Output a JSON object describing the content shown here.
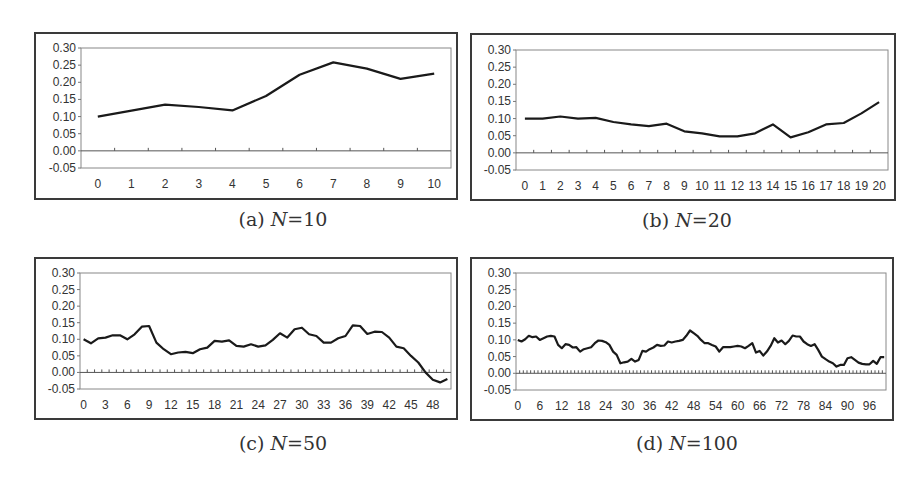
{
  "chart_data": [
    {
      "id": "a",
      "type": "line",
      "caption": {
        "label": "(a)",
        "var": "N",
        "eq": "=10"
      },
      "x": [
        0,
        1,
        2,
        3,
        4,
        5,
        6,
        7,
        8,
        9,
        10
      ],
      "x_tick_labels": [
        "0",
        "1",
        "2",
        "3",
        "4",
        "5",
        "6",
        "7",
        "8",
        "9",
        "10"
      ],
      "x_label_step": 1,
      "values": [
        0.1,
        0.117,
        0.135,
        0.128,
        0.118,
        0.16,
        0.222,
        0.258,
        0.24,
        0.21,
        0.225
      ],
      "y_tick_labels": [
        "0.30",
        "0.25",
        "0.20",
        "0.15",
        "0.10",
        "0.05",
        "0.00",
        "-0.05"
      ],
      "ylim": [
        -0.05,
        0.3
      ],
      "xlabel": "",
      "ylabel": "",
      "grid": false,
      "legend": null
    },
    {
      "id": "b",
      "type": "line",
      "caption": {
        "label": "(b)",
        "var": "N",
        "eq": "=20"
      },
      "x": [
        0,
        1,
        2,
        3,
        4,
        5,
        6,
        7,
        8,
        9,
        10,
        11,
        12,
        13,
        14,
        15,
        16,
        17,
        18,
        19,
        20
      ],
      "x_tick_labels": [
        "0",
        "1",
        "2",
        "3",
        "4",
        "5",
        "6",
        "7",
        "8",
        "9",
        "10",
        "11",
        "12",
        "13",
        "14",
        "15",
        "16",
        "17",
        "18",
        "19",
        "20"
      ],
      "x_label_step": 1,
      "values": [
        0.1,
        0.1,
        0.106,
        0.1,
        0.102,
        0.09,
        0.083,
        0.078,
        0.085,
        0.063,
        0.057,
        0.048,
        0.048,
        0.057,
        0.083,
        0.045,
        0.06,
        0.083,
        0.087,
        0.115,
        0.148
      ],
      "y_tick_labels": [
        "0.30",
        "0.25",
        "0.20",
        "0.15",
        "0.10",
        "0.05",
        "0.00",
        "-0.05"
      ],
      "ylim": [
        -0.05,
        0.3
      ],
      "xlabel": "",
      "ylabel": "",
      "grid": false,
      "legend": null
    },
    {
      "id": "c",
      "type": "line",
      "caption": {
        "label": "(c)",
        "var": "N",
        "eq": "=50"
      },
      "x_count": 51,
      "x_tick_labels": [
        "0",
        "3",
        "6",
        "9",
        "12",
        "15",
        "18",
        "21",
        "24",
        "27",
        "30",
        "33",
        "36",
        "39",
        "42",
        "45",
        "48"
      ],
      "x_label_step": 3,
      "values": [
        0.1,
        0.088,
        0.103,
        0.105,
        0.112,
        0.112,
        0.1,
        0.115,
        0.138,
        0.14,
        0.09,
        0.07,
        0.055,
        0.06,
        0.062,
        0.058,
        0.07,
        0.075,
        0.095,
        0.093,
        0.097,
        0.08,
        0.078,
        0.085,
        0.078,
        0.082,
        0.098,
        0.118,
        0.105,
        0.13,
        0.135,
        0.115,
        0.11,
        0.09,
        0.09,
        0.103,
        0.11,
        0.142,
        0.14,
        0.116,
        0.123,
        0.122,
        0.105,
        0.078,
        0.073,
        0.05,
        0.03,
        0.0,
        -0.022,
        -0.03,
        -0.02
      ],
      "y_tick_labels": [
        "0.30",
        "0.25",
        "0.20",
        "0.15",
        "0.10",
        "0.05",
        "0.00",
        "-0.05"
      ],
      "ylim": [
        -0.05,
        0.3
      ],
      "xlabel": "",
      "ylabel": "",
      "grid": false,
      "legend": null
    },
    {
      "id": "d",
      "type": "line",
      "caption": {
        "label": "(d)",
        "var": "N",
        "eq": "=100"
      },
      "x_count": 101,
      "x_tick_labels": [
        "0",
        "6",
        "12",
        "18",
        "24",
        "30",
        "36",
        "42",
        "48",
        "54",
        "60",
        "66",
        "72",
        "78",
        "84",
        "90",
        "96"
      ],
      "x_label_step": 6,
      "values": [
        0.1,
        0.095,
        0.102,
        0.112,
        0.108,
        0.11,
        0.1,
        0.105,
        0.11,
        0.112,
        0.11,
        0.085,
        0.075,
        0.087,
        0.085,
        0.077,
        0.078,
        0.065,
        0.072,
        0.075,
        0.078,
        0.09,
        0.098,
        0.097,
        0.093,
        0.085,
        0.065,
        0.055,
        0.03,
        0.033,
        0.035,
        0.043,
        0.035,
        0.04,
        0.067,
        0.065,
        0.072,
        0.077,
        0.085,
        0.082,
        0.083,
        0.095,
        0.092,
        0.095,
        0.097,
        0.1,
        0.112,
        0.128,
        0.12,
        0.112,
        0.1,
        0.09,
        0.09,
        0.085,
        0.08,
        0.065,
        0.078,
        0.078,
        0.078,
        0.08,
        0.082,
        0.08,
        0.075,
        0.082,
        0.09,
        0.062,
        0.067,
        0.053,
        0.065,
        0.082,
        0.105,
        0.092,
        0.098,
        0.087,
        0.097,
        0.113,
        0.11,
        0.11,
        0.095,
        0.087,
        0.082,
        0.087,
        0.07,
        0.05,
        0.042,
        0.035,
        0.03,
        0.02,
        0.025,
        0.025,
        0.045,
        0.048,
        0.04,
        0.032,
        0.028,
        0.027,
        0.027,
        0.037,
        0.028,
        0.048,
        0.048
      ],
      "y_tick_labels": [
        "0.30",
        "0.25",
        "0.20",
        "0.15",
        "0.10",
        "0.05",
        "0.00",
        "-0.05"
      ],
      "ylim": [
        -0.05,
        0.3
      ],
      "xlabel": "",
      "ylabel": "",
      "grid": false,
      "legend": null
    }
  ],
  "layout_panels": [
    {
      "frame": [
        34,
        32,
        424,
        168
      ],
      "plot": [
        81,
        48,
        451,
        168
      ],
      "caption_xy": [
        283,
        220
      ]
    },
    {
      "frame": [
        470,
        33,
        426,
        168
      ],
      "plot": [
        516,
        50,
        888,
        170
      ],
      "caption_xy": [
        687,
        221
      ]
    },
    {
      "frame": [
        34,
        257,
        424,
        163
      ],
      "plot": [
        80,
        273,
        451,
        389
      ],
      "caption_xy": [
        283,
        444
      ]
    },
    {
      "frame": [
        470,
        257,
        424,
        164
      ],
      "plot": [
        516,
        273,
        886,
        390
      ],
      "caption_xy": [
        687,
        444
      ]
    }
  ]
}
